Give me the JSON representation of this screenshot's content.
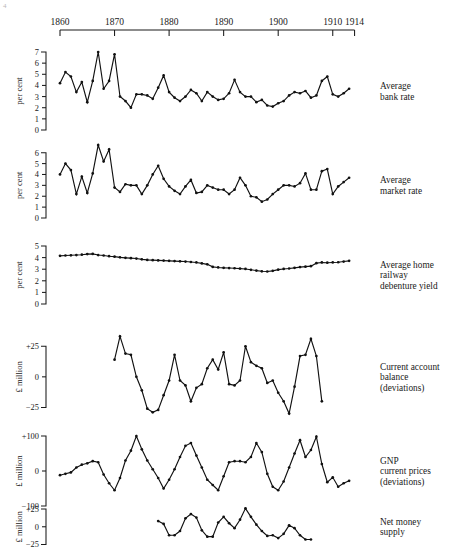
{
  "figure": {
    "corner_mark": "4",
    "background": "#ffffff",
    "ink_color": "#111111"
  },
  "timeline": {
    "label": "decade-axis",
    "ticks": [
      {
        "label": "1860",
        "year": 1860
      },
      {
        "label": "1870",
        "year": 1870
      },
      {
        "label": "1880",
        "year": 1880
      },
      {
        "label": "1890",
        "year": 1890
      },
      {
        "label": "1900",
        "year": 1900
      },
      {
        "label": "1910",
        "year": 1910
      },
      {
        "label": "1914",
        "year": 1914
      }
    ],
    "start_year": 1860,
    "end_year": 1914
  },
  "chart_data": [
    {
      "type": "line",
      "name": "average-bank-rate",
      "title": "Average bank rate",
      "title_lines": [
        "Average",
        "bank rate"
      ],
      "ylabel": "per cent",
      "xlabel": "",
      "ylim": [
        0,
        7
      ],
      "yticks": [
        0,
        1,
        2,
        3,
        4,
        5,
        6,
        7
      ],
      "ytick_labels": [
        "0",
        "1",
        "2",
        "3",
        "4",
        "5",
        "6",
        "7"
      ],
      "grid": false,
      "markers": true,
      "x": [
        1860,
        1861,
        1862,
        1863,
        1864,
        1865,
        1866,
        1867,
        1868,
        1869,
        1870,
        1871,
        1872,
        1873,
        1874,
        1875,
        1876,
        1877,
        1878,
        1879,
        1880,
        1881,
        1882,
        1883,
        1884,
        1885,
        1886,
        1887,
        1888,
        1889,
        1890,
        1891,
        1892,
        1893,
        1894,
        1895,
        1896,
        1897,
        1898,
        1899,
        1900,
        1901,
        1902,
        1903,
        1904,
        1905,
        1906,
        1907,
        1908,
        1909,
        1910,
        1911,
        1912,
        1913
      ],
      "values": [
        4.2,
        5.2,
        4.8,
        3.4,
        4.3,
        2.5,
        4.4,
        7.0,
        3.7,
        4.4,
        6.8,
        3.0,
        2.6,
        2.0,
        3.2,
        3.2,
        3.1,
        2.8,
        3.8,
        4.9,
        3.4,
        2.9,
        2.6,
        3.0,
        3.6,
        3.3,
        2.6,
        3.4,
        3.0,
        2.7,
        2.8,
        3.3,
        4.5,
        3.4,
        3.0,
        3.0,
        2.5,
        2.7,
        2.2,
        2.1,
        2.4,
        2.6,
        3.1,
        3.4,
        3.3,
        3.5,
        2.9,
        3.1,
        4.4,
        4.8,
        3.2,
        3.0,
        3.3,
        3.7,
        3.8
      ]
    },
    {
      "type": "line",
      "name": "average-market-rate",
      "title": "Average market rate",
      "title_lines": [
        "Average",
        "market rate"
      ],
      "ylabel": "per cent",
      "xlabel": "",
      "ylim": [
        0,
        6.8
      ],
      "yticks": [
        0,
        1,
        2,
        3,
        4,
        5,
        6
      ],
      "ytick_labels": [
        "0",
        "1",
        "2",
        "3",
        "4",
        "5",
        "6"
      ],
      "grid": false,
      "markers": true,
      "x": [
        1860,
        1861,
        1862,
        1863,
        1864,
        1865,
        1866,
        1867,
        1868,
        1869,
        1870,
        1871,
        1872,
        1873,
        1874,
        1875,
        1876,
        1877,
        1878,
        1879,
        1880,
        1881,
        1882,
        1883,
        1884,
        1885,
        1886,
        1887,
        1888,
        1889,
        1890,
        1891,
        1892,
        1893,
        1894,
        1895,
        1896,
        1897,
        1898,
        1899,
        1900,
        1901,
        1902,
        1903,
        1904,
        1905,
        1906,
        1907,
        1908,
        1909,
        1910,
        1911,
        1912,
        1913
      ],
      "values": [
        4.0,
        5.0,
        4.4,
        2.2,
        3.8,
        2.3,
        4.1,
        6.7,
        5.2,
        6.3,
        2.8,
        2.4,
        3.1,
        3.0,
        3.0,
        2.2,
        3.0,
        4.0,
        4.8,
        3.6,
        2.9,
        2.5,
        2.2,
        2.9,
        3.5,
        2.3,
        2.4,
        3.0,
        2.8,
        2.6,
        2.6,
        2.2,
        2.6,
        3.7,
        3.0,
        2.0,
        1.9,
        1.5,
        1.7,
        2.2,
        2.6,
        3.0,
        3.0,
        2.9,
        3.2,
        4.1,
        2.6,
        2.6,
        4.3,
        4.5,
        2.2,
        2.9,
        3.3,
        3.7,
        4.2
      ]
    },
    {
      "type": "line",
      "name": "average-home-railway-debenture-yield",
      "title": "Average home railway debenture yield",
      "title_lines": [
        "Average home",
        "railway",
        "debenture yield"
      ],
      "ylabel": "per cent",
      "xlabel": "",
      "ylim": [
        0,
        5
      ],
      "yticks": [
        0,
        1,
        2,
        3,
        4,
        5
      ],
      "ytick_labels": [
        "0",
        "1",
        "2",
        "3",
        "4",
        "5"
      ],
      "grid": false,
      "markers": true,
      "x": [
        1860,
        1861,
        1862,
        1863,
        1864,
        1865,
        1866,
        1867,
        1868,
        1869,
        1870,
        1871,
        1872,
        1873,
        1874,
        1875,
        1876,
        1877,
        1878,
        1879,
        1880,
        1881,
        1882,
        1883,
        1884,
        1885,
        1886,
        1887,
        1888,
        1889,
        1890,
        1891,
        1892,
        1893,
        1894,
        1895,
        1896,
        1897,
        1898,
        1899,
        1900,
        1901,
        1902,
        1903,
        1904,
        1905,
        1906,
        1907,
        1908,
        1909,
        1910,
        1911,
        1912,
        1913
      ],
      "values": [
        4.15,
        4.18,
        4.2,
        4.22,
        4.25,
        4.3,
        4.32,
        4.22,
        4.18,
        4.12,
        4.08,
        4.02,
        3.98,
        3.95,
        3.92,
        3.85,
        3.8,
        3.78,
        3.76,
        3.74,
        3.72,
        3.7,
        3.68,
        3.66,
        3.62,
        3.58,
        3.5,
        3.42,
        3.2,
        3.15,
        3.12,
        3.1,
        3.08,
        3.05,
        3.02,
        2.95,
        2.88,
        2.82,
        2.8,
        2.86,
        2.96,
        3.02,
        3.06,
        3.12,
        3.18,
        3.22,
        3.26,
        3.52,
        3.58,
        3.56,
        3.58,
        3.6,
        3.66,
        3.72,
        3.76
      ]
    },
    {
      "type": "line",
      "name": "current-account-balance-deviations",
      "title": "Current account balance (deviations)",
      "title_lines": [
        "Current account",
        "balance",
        "(deviations)"
      ],
      "ylabel": "£ million",
      "xlabel": "",
      "ylim": [
        -32,
        35
      ],
      "yticks": [
        -25,
        0,
        25
      ],
      "ytick_labels": [
        "−25",
        "0",
        "+25"
      ],
      "grid": false,
      "markers": true,
      "x": [
        1870,
        1871,
        1872,
        1873,
        1874,
        1875,
        1876,
        1877,
        1878,
        1879,
        1880,
        1881,
        1882,
        1883,
        1884,
        1885,
        1886,
        1887,
        1888,
        1889,
        1890,
        1891,
        1892,
        1893,
        1894,
        1895,
        1896,
        1897,
        1898,
        1899,
        1900,
        1901,
        1902,
        1903,
        1904,
        1905,
        1906,
        1907,
        1908,
        1909
      ],
      "values": [
        14,
        33,
        19,
        18,
        0,
        -11,
        -26,
        -29,
        -27,
        -15,
        -3,
        18,
        -3,
        -7,
        -20,
        -9,
        -6,
        7,
        14,
        6,
        20,
        -6,
        -7,
        -3,
        25,
        12,
        9,
        7,
        -5,
        -3,
        -13,
        -20,
        -30,
        -8,
        17,
        18,
        31,
        17,
        -20,
        null
      ]
    },
    {
      "type": "line",
      "name": "gnp-current-prices-deviations",
      "title": "GNP current prices (deviations)",
      "title_lines": [
        "GNP",
        "current prices",
        "(deviations)"
      ],
      "ylabel": "£ million",
      "xlabel": "",
      "ylim": [
        -100,
        100
      ],
      "yticks": [
        -100,
        0,
        100
      ],
      "ytick_labels": [
        "−100",
        "0",
        "+100"
      ],
      "grid": false,
      "markers": true,
      "x": [
        1860,
        1861,
        1862,
        1863,
        1864,
        1865,
        1866,
        1867,
        1868,
        1869,
        1870,
        1871,
        1872,
        1873,
        1874,
        1875,
        1876,
        1877,
        1878,
        1879,
        1880,
        1881,
        1882,
        1883,
        1884,
        1885,
        1886,
        1887,
        1888,
        1889,
        1890,
        1891,
        1892,
        1893,
        1894,
        1895,
        1896,
        1897,
        1898,
        1899,
        1900,
        1901,
        1902,
        1903,
        1904,
        1905,
        1906,
        1907,
        1908,
        1909,
        1910,
        1911,
        1912,
        1913
      ],
      "values": [
        -12,
        -8,
        -4,
        10,
        18,
        22,
        28,
        25,
        -10,
        -35,
        -55,
        -20,
        30,
        58,
        100,
        62,
        30,
        5,
        -20,
        -50,
        -25,
        5,
        40,
        72,
        80,
        44,
        10,
        -25,
        -40,
        -55,
        -15,
        25,
        28,
        28,
        25,
        40,
        80,
        54,
        -8,
        -45,
        -55,
        -30,
        10,
        50,
        88,
        40,
        60,
        98,
        20,
        -32,
        -18,
        -45,
        -35,
        -28
      ]
    },
    {
      "type": "line",
      "name": "net-money-supply",
      "title": "Net money supply",
      "title_lines": [
        "Net money",
        "supply"
      ],
      "ylabel": "£ million",
      "xlabel": "",
      "ylim": [
        -30,
        35
      ],
      "yticks": [
        -25,
        0,
        25
      ],
      "ytick_labels": [
        "−25",
        "0",
        "+25"
      ],
      "grid": false,
      "markers": true,
      "x": [
        1878,
        1879,
        1880,
        1881,
        1882,
        1883,
        1884,
        1885,
        1886,
        1887,
        1888,
        1889,
        1890,
        1891,
        1892,
        1893,
        1894,
        1895,
        1896,
        1897,
        1898,
        1899,
        1900,
        1901,
        1902,
        1903,
        1904,
        1905,
        1906,
        1907,
        1908,
        1909,
        1910,
        1911
      ],
      "values": [
        8,
        4,
        -12,
        -12,
        -6,
        12,
        18,
        13,
        -5,
        -14,
        -14,
        6,
        14,
        5,
        -2,
        10,
        26,
        14,
        3,
        -6,
        -13,
        -12,
        -16,
        -10,
        2,
        -2,
        -12,
        -18,
        -18,
        null,
        null,
        null,
        null,
        null
      ]
    }
  ]
}
